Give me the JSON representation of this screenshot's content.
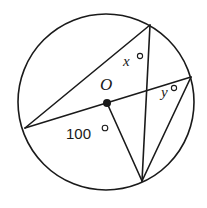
{
  "diagram": {
    "type": "circle-geometry",
    "circle": {
      "cx": 106,
      "cy": 102,
      "r": 88
    },
    "center": {
      "label": "O",
      "x": 107,
      "y": 103
    },
    "points": {
      "top": {
        "x": 150,
        "y": 25
      },
      "left": {
        "x": 25,
        "y": 128
      },
      "right": {
        "x": 191,
        "y": 77
      },
      "bottom": {
        "x": 142,
        "y": 181
      }
    },
    "segments": [
      {
        "from": "left",
        "to": "top"
      },
      {
        "from": "left",
        "to": "right"
      },
      {
        "from": "top",
        "to": "bottom"
      },
      {
        "from": "right",
        "to": "bottom"
      },
      {
        "from": "center",
        "to": "bottom"
      }
    ],
    "labels": {
      "center": "O",
      "angle_x": "x",
      "angle_y": "y",
      "angle_center": "100",
      "degree": "°"
    }
  }
}
